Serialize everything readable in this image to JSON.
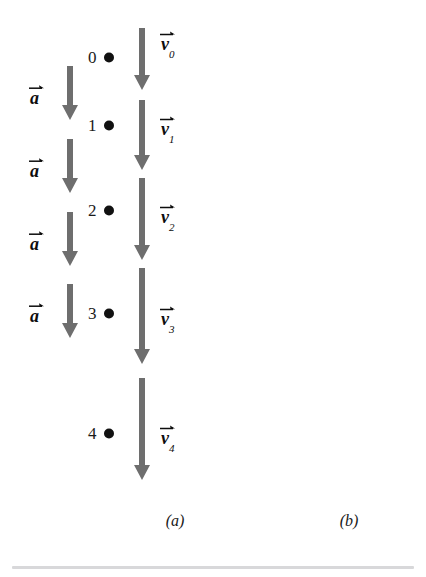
{
  "figure": {
    "background_color": "#ffffff",
    "arrow_color": "#6e6e6e",
    "marker_color": "#111111",
    "text_color": "#1a1a1a",
    "divider_color": "#d8d8da"
  },
  "panels": [
    {
      "id": "a",
      "caption": "(a)",
      "caption_x": 175,
      "caption_y": 512,
      "description": "falling object speeding up",
      "markers": [
        {
          "label": "0",
          "x": 88,
          "y": 57
        },
        {
          "label": "1",
          "x": 88,
          "y": 125
        },
        {
          "label": "2",
          "x": 88,
          "y": 210
        },
        {
          "label": "3",
          "x": 88,
          "y": 313
        },
        {
          "label": "4",
          "x": 88,
          "y": 433
        }
      ],
      "velocity_arrows": [
        {
          "name": "v0",
          "direction": "down",
          "x": 134,
          "top": 28,
          "length": 62
        },
        {
          "name": "v1",
          "direction": "down",
          "x": 134,
          "top": 100,
          "length": 70
        },
        {
          "name": "v2",
          "direction": "down",
          "x": 134,
          "top": 178,
          "length": 82
        },
        {
          "name": "v3",
          "direction": "down",
          "x": 134,
          "top": 268,
          "length": 96
        },
        {
          "name": "v4",
          "direction": "down",
          "x": 134,
          "top": 378,
          "length": 102
        }
      ],
      "velocity_labels": [
        {
          "symbol": "v",
          "subscript": "0",
          "x": 161,
          "y": 43
        },
        {
          "symbol": "v",
          "subscript": "1",
          "x": 161,
          "y": 128
        },
        {
          "symbol": "v",
          "subscript": "2",
          "x": 161,
          "y": 216
        },
        {
          "symbol": "v",
          "subscript": "3",
          "x": 161,
          "y": 318
        },
        {
          "symbol": "v",
          "subscript": "4",
          "x": 161,
          "y": 437
        }
      ],
      "acceleration_arrows": [
        {
          "name": "a",
          "direction": "down",
          "x": 62,
          "top": 66,
          "length": 54
        },
        {
          "name": "a",
          "direction": "down",
          "x": 62,
          "top": 139,
          "length": 54
        },
        {
          "name": "a",
          "direction": "down",
          "x": 62,
          "top": 212,
          "length": 54
        },
        {
          "name": "a",
          "direction": "down",
          "x": 62,
          "top": 284,
          "length": 54
        }
      ],
      "acceleration_labels": [
        {
          "symbol": "a",
          "subscript": "",
          "x": 30,
          "y": 95
        },
        {
          "symbol": "a",
          "subscript": "",
          "x": 30,
          "y": 168
        },
        {
          "symbol": "a",
          "subscript": "",
          "x": 30,
          "y": 241
        },
        {
          "symbol": "a",
          "subscript": "",
          "x": 30,
          "y": 313
        }
      ]
    },
    {
      "id": "b",
      "caption": "(b)",
      "caption_x": 349,
      "caption_y": 512,
      "description": "rising object slowing down",
      "markers": [
        {
          "label": "4",
          "x": 301,
          "y": 63
        },
        {
          "label": "3",
          "x": 301,
          "y": 116
        },
        {
          "label": "2",
          "x": 301,
          "y": 190
        },
        {
          "label": "1",
          "x": 301,
          "y": 283
        },
        {
          "label": "0",
          "x": 301,
          "y": 395
        }
      ],
      "velocity_arrows": [
        {
          "name": "v4",
          "direction": "up",
          "x": 347,
          "top": 33,
          "length": 58
        },
        {
          "name": "v3",
          "direction": "up",
          "x": 347,
          "top": 101,
          "length": 72
        },
        {
          "name": "v2",
          "direction": "up",
          "x": 347,
          "top": 184,
          "length": 88
        },
        {
          "name": "v1",
          "direction": "up",
          "x": 347,
          "top": 288,
          "length": 88
        },
        {
          "name": "v0",
          "direction": "up",
          "x": 347,
          "top": 388,
          "length": 100
        }
      ],
      "velocity_labels": [
        {
          "symbol": "v",
          "subscript": "4",
          "x": 374,
          "y": 55
        },
        {
          "symbol": "v",
          "subscript": "3",
          "x": 374,
          "y": 140
        },
        {
          "symbol": "v",
          "subscript": "2",
          "x": 374,
          "y": 252
        },
        {
          "symbol": "v",
          "subscript": "1",
          "x": 374,
          "y": 345
        },
        {
          "symbol": "v",
          "subscript": "0",
          "x": 374,
          "y": 455
        }
      ],
      "acceleration_arrows": [
        {
          "name": "a",
          "direction": "down",
          "x": 275,
          "top": 66,
          "length": 54
        },
        {
          "name": "a",
          "direction": "down",
          "x": 275,
          "top": 139,
          "length": 54
        },
        {
          "name": "a",
          "direction": "down",
          "x": 275,
          "top": 212,
          "length": 54
        },
        {
          "name": "a",
          "direction": "down",
          "x": 275,
          "top": 284,
          "length": 54
        }
      ],
      "acceleration_labels": [
        {
          "symbol": "a",
          "subscript": "",
          "x": 243,
          "y": 95
        },
        {
          "symbol": "a",
          "subscript": "",
          "x": 243,
          "y": 168
        },
        {
          "symbol": "a",
          "subscript": "",
          "x": 243,
          "y": 241
        },
        {
          "symbol": "a",
          "subscript": "",
          "x": 243,
          "y": 313
        }
      ]
    }
  ]
}
